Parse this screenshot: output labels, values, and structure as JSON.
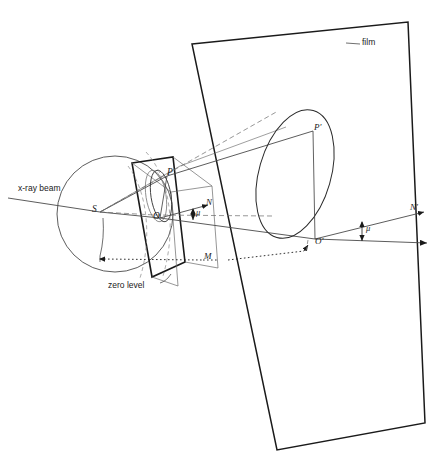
{
  "figure": {
    "background_color": "#ffffff",
    "line_color": "#1a1a1a",
    "width": 431,
    "height": 464
  },
  "labels": {
    "xray_beam": "x-ray beam",
    "zero_level": "zero level",
    "film": "film",
    "point_S": "S",
    "point_P": "P",
    "point_O": "O",
    "point_N": "N",
    "point_M": "M",
    "point_P_prime": "P'",
    "point_O_prime": "O'",
    "point_N_prime": "N'",
    "angle_mu_left": "μ",
    "angle_mu_right": "μ"
  },
  "elements": {
    "sphere": {
      "name": "sphere-of-reflection",
      "cx": 115,
      "cy": 214,
      "r": 58
    },
    "crystal_plate": {
      "name": "crystal-layer-plate"
    },
    "film_plane": {
      "name": "film-plane-rectangle"
    },
    "small_ellipse": {
      "name": "reciprocal-lattice-circle"
    },
    "large_ellipse": {
      "name": "projected-cone-ellipse"
    },
    "cone_rays": {
      "name": "diffraction-cone-rays"
    }
  },
  "colors": {
    "stroke": "#1a1a1a",
    "thin_stroke": "#555555",
    "text": "#1a1a1a"
  }
}
